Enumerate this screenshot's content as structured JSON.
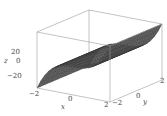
{
  "chart_data": {
    "type": "surface3d",
    "title": "",
    "xlabel": "x",
    "ylabel": "y",
    "zlabel": "z",
    "xlim": [
      -2,
      2
    ],
    "ylim": [
      -2,
      2
    ],
    "zlim": [
      -30,
      30
    ],
    "x_ticks": [
      "−2",
      "0",
      "2"
    ],
    "y_ticks": [
      "−2",
      "0",
      "2"
    ],
    "z_ticks": [
      "20",
      "0",
      "−20"
    ],
    "grid": "mesh",
    "mesh_resolution": 20,
    "surface_color": "#5a5a5a",
    "mesh_color": "#2b2b2b",
    "box_color": "#9a9a9a",
    "corner_values": {
      "x=-2,y=-2": -30,
      "x=2,y=-2": 30,
      "x=2,y=2": 30,
      "x=-2,y=2": -30
    }
  }
}
